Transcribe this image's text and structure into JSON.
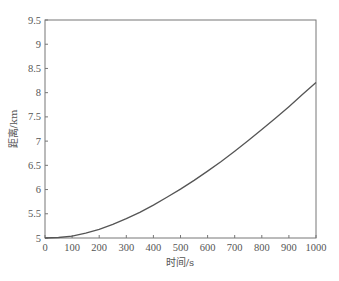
{
  "chart_data": {
    "type": "line",
    "title": "",
    "xlabel": "时间/s",
    "ylabel": "距离/km",
    "xlim": [
      0,
      1000
    ],
    "ylim": [
      5,
      9.5
    ],
    "grid": false,
    "legend": null,
    "x_ticks": [
      "0",
      "100",
      "200",
      "300",
      "400",
      "500",
      "600",
      "700",
      "800",
      "900",
      "1000"
    ],
    "y_ticks": [
      "5",
      "5.5",
      "6",
      "6.5",
      "7",
      "7.5",
      "8",
      "8.5",
      "9",
      "9.5"
    ],
    "series": [
      {
        "name": "distance",
        "color": "#555555",
        "x": [
          0,
          50,
          100,
          150,
          200,
          250,
          300,
          350,
          400,
          450,
          500,
          550,
          600,
          650,
          700,
          750,
          800,
          850,
          900,
          950,
          1000
        ],
        "y": [
          5.0,
          5.01,
          5.04,
          5.1,
          5.18,
          5.28,
          5.4,
          5.53,
          5.68,
          5.84,
          6.01,
          6.19,
          6.38,
          6.58,
          6.79,
          7.01,
          7.24,
          7.47,
          7.71,
          7.96,
          8.21
        ]
      }
    ]
  }
}
